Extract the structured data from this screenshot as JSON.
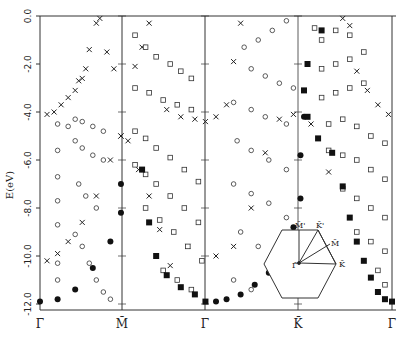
{
  "chart_data": {
    "type": "scatter",
    "title": "",
    "xlabel": "",
    "ylabel": "E(eV)",
    "ylim": [
      -12.0,
      0.0
    ],
    "yticks": [
      0.0,
      -2.0,
      -4.0,
      -6.0,
      -8.0,
      -10.0,
      -12.0
    ],
    "ytick_labels": [
      "0.0",
      "-2.0",
      "-4.0",
      "-6.0",
      "-8.0",
      "-10.0",
      "-12.0"
    ],
    "x_symmetry_points": [
      {
        "label": "Γ̄",
        "pos": 0.0
      },
      {
        "label": "M̄",
        "pos": 0.235
      },
      {
        "label": "Γ̄",
        "pos": 0.471
      },
      {
        "label": "K̄",
        "pos": 0.735
      },
      {
        "label": "Γ̄",
        "pos": 1.0
      }
    ],
    "legend": [],
    "marker_types": [
      "open-circle",
      "open-square",
      "cross",
      "filled-circle",
      "filled-square"
    ],
    "series": [
      {
        "name": "surface states (crosses)",
        "marker": "cross",
        "points": [
          [
            0.02,
            -4.1
          ],
          [
            0.04,
            -4.0
          ],
          [
            0.06,
            -3.7
          ],
          [
            0.08,
            -3.4
          ],
          [
            0.1,
            -3.1
          ],
          [
            0.12,
            -2.6
          ],
          [
            0.14,
            -1.4
          ],
          [
            0.16,
            -0.3
          ],
          [
            0.17,
            -0.1
          ],
          [
            0.19,
            -1.5
          ],
          [
            0.21,
            -2.2
          ],
          [
            0.23,
            -5.0
          ],
          [
            0.25,
            -5.2
          ],
          [
            0.27,
            -2.1
          ],
          [
            0.29,
            -1.3
          ],
          [
            0.31,
            -0.3
          ],
          [
            0.13,
            -2.2
          ],
          [
            0.11,
            -2.7
          ],
          [
            0.36,
            -3.9
          ],
          [
            0.4,
            -4.2
          ],
          [
            0.44,
            -4.3
          ],
          [
            0.47,
            -4.4
          ],
          [
            0.5,
            -4.2
          ],
          [
            0.53,
            -3.7
          ],
          [
            0.55,
            -1.9
          ],
          [
            0.57,
            -0.3
          ],
          [
            0.02,
            -10.2
          ],
          [
            0.05,
            -9.9
          ],
          [
            0.08,
            -9.4
          ],
          [
            0.12,
            -8.6
          ],
          [
            0.16,
            -7.5
          ],
          [
            0.2,
            -6.0
          ],
          [
            0.23,
            -5.0
          ],
          [
            0.28,
            -6.4
          ],
          [
            0.31,
            -7.5
          ],
          [
            0.34,
            -8.9
          ],
          [
            0.37,
            -10.4
          ],
          [
            0.42,
            -9.6
          ],
          [
            0.5,
            -10.0
          ],
          [
            0.55,
            -9.6
          ],
          [
            0.6,
            -8.0
          ],
          [
            0.64,
            -5.7
          ],
          [
            0.68,
            -4.3
          ],
          [
            0.72,
            -4.1
          ],
          [
            0.77,
            -4.5
          ],
          [
            0.82,
            -6.5
          ],
          [
            0.86,
            -0.1
          ],
          [
            0.88,
            -0.4
          ],
          [
            0.9,
            -2.3
          ],
          [
            0.93,
            -3.1
          ],
          [
            0.96,
            -3.7
          ],
          [
            0.99,
            -4.1
          ]
        ]
      },
      {
        "name": "bulk bands (open circles)",
        "marker": "open-circle",
        "points": [
          [
            0.05,
            -4.5
          ],
          [
            0.08,
            -4.6
          ],
          [
            0.05,
            -5.6
          ],
          [
            0.05,
            -6.7
          ],
          [
            0.05,
            -7.7
          ],
          [
            0.05,
            -8.7
          ],
          [
            0.05,
            -10.3
          ],
          [
            0.05,
            -11.0
          ],
          [
            0.1,
            -4.3
          ],
          [
            0.12,
            -4.4
          ],
          [
            0.15,
            -4.6
          ],
          [
            0.18,
            -4.8
          ],
          [
            0.1,
            -5.2
          ],
          [
            0.12,
            -5.5
          ],
          [
            0.15,
            -5.8
          ],
          [
            0.18,
            -6.0
          ],
          [
            0.11,
            -7.0
          ],
          [
            0.13,
            -7.5
          ],
          [
            0.16,
            -8.0
          ],
          [
            0.1,
            -9.1
          ],
          [
            0.12,
            -9.6
          ],
          [
            0.14,
            -10.3
          ],
          [
            0.16,
            -11.0
          ],
          [
            0.18,
            -11.5
          ],
          [
            0.2,
            -11.8
          ],
          [
            0.58,
            -1.3
          ],
          [
            0.62,
            -1.0
          ],
          [
            0.66,
            -0.6
          ],
          [
            0.7,
            -0.2
          ],
          [
            0.6,
            -2.2
          ],
          [
            0.64,
            -2.5
          ],
          [
            0.68,
            -2.8
          ],
          [
            0.72,
            -3.0
          ],
          [
            0.55,
            -3.6
          ],
          [
            0.6,
            -3.9
          ],
          [
            0.64,
            -4.2
          ],
          [
            0.7,
            -4.5
          ],
          [
            0.56,
            -5.2
          ],
          [
            0.6,
            -5.6
          ],
          [
            0.65,
            -6.0
          ],
          [
            0.7,
            -6.4
          ],
          [
            0.55,
            -7.0
          ],
          [
            0.6,
            -7.4
          ],
          [
            0.65,
            -7.8
          ],
          [
            0.7,
            -8.4
          ],
          [
            0.57,
            -9.0
          ],
          [
            0.62,
            -9.6
          ],
          [
            0.67,
            -10.2
          ],
          [
            0.72,
            -10.8
          ],
          [
            0.55,
            -11.0
          ],
          [
            0.6,
            -11.4
          ]
        ]
      },
      {
        "name": "bulk bands (open squares)",
        "marker": "open-square",
        "points": [
          [
            0.27,
            -0.8
          ],
          [
            0.3,
            -1.3
          ],
          [
            0.33,
            -1.7
          ],
          [
            0.37,
            -2.0
          ],
          [
            0.4,
            -2.3
          ],
          [
            0.43,
            -2.6
          ],
          [
            0.27,
            -3.0
          ],
          [
            0.31,
            -3.2
          ],
          [
            0.35,
            -3.5
          ],
          [
            0.39,
            -3.7
          ],
          [
            0.43,
            -3.9
          ],
          [
            0.27,
            -4.8
          ],
          [
            0.3,
            -5.1
          ],
          [
            0.33,
            -5.5
          ],
          [
            0.37,
            -5.9
          ],
          [
            0.41,
            -6.4
          ],
          [
            0.45,
            -6.9
          ],
          [
            0.27,
            -6.2
          ],
          [
            0.3,
            -6.6
          ],
          [
            0.33,
            -7.0
          ],
          [
            0.37,
            -7.5
          ],
          [
            0.41,
            -8.0
          ],
          [
            0.45,
            -8.6
          ],
          [
            0.3,
            -8.0
          ],
          [
            0.34,
            -8.5
          ],
          [
            0.38,
            -9.0
          ],
          [
            0.42,
            -9.6
          ],
          [
            0.46,
            -10.2
          ],
          [
            0.35,
            -10.6
          ],
          [
            0.39,
            -11.0
          ],
          [
            0.43,
            -11.4
          ],
          [
            0.78,
            -0.5
          ],
          [
            0.8,
            -1.0
          ],
          [
            0.84,
            -0.6
          ],
          [
            0.88,
            -0.8
          ],
          [
            0.8,
            -2.2
          ],
          [
            0.84,
            -2.0
          ],
          [
            0.88,
            -1.8
          ],
          [
            0.92,
            -1.5
          ],
          [
            0.8,
            -3.4
          ],
          [
            0.84,
            -3.2
          ],
          [
            0.88,
            -3.0
          ],
          [
            0.92,
            -2.8
          ],
          [
            0.82,
            -4.5
          ],
          [
            0.86,
            -4.3
          ],
          [
            0.9,
            -4.6
          ],
          [
            0.94,
            -5.0
          ],
          [
            0.98,
            -5.3
          ],
          [
            0.82,
            -5.6
          ],
          [
            0.86,
            -5.8
          ],
          [
            0.9,
            -6.0
          ],
          [
            0.94,
            -6.4
          ],
          [
            0.98,
            -6.8
          ],
          [
            0.86,
            -7.2
          ],
          [
            0.9,
            -7.6
          ],
          [
            0.94,
            -8.0
          ],
          [
            0.98,
            -8.4
          ],
          [
            0.9,
            -9.0
          ],
          [
            0.94,
            -9.4
          ],
          [
            0.98,
            -9.8
          ],
          [
            0.96,
            -10.6
          ],
          [
            0.98,
            -11.2
          ]
        ]
      },
      {
        "name": "bulk band edge (filled circles)",
        "marker": "filled-circle",
        "points": [
          [
            0.0,
            -11.9
          ],
          [
            0.05,
            -11.8
          ],
          [
            0.1,
            -11.4
          ],
          [
            0.15,
            -10.5
          ],
          [
            0.2,
            -9.4
          ],
          [
            0.23,
            -8.2
          ],
          [
            0.23,
            -7.0
          ],
          [
            0.5,
            -11.9
          ],
          [
            0.53,
            -11.8
          ],
          [
            0.57,
            -11.6
          ],
          [
            0.61,
            -11.2
          ],
          [
            0.65,
            -10.7
          ],
          [
            0.69,
            -9.9
          ],
          [
            0.72,
            -8.8
          ],
          [
            0.74,
            -7.6
          ],
          [
            0.74,
            -5.8
          ],
          [
            0.75,
            -4.2
          ]
        ]
      },
      {
        "name": "bulk band edge (filled squares)",
        "marker": "filled-square",
        "points": [
          [
            0.29,
            -6.4
          ],
          [
            0.31,
            -8.6
          ],
          [
            0.33,
            -10.0
          ],
          [
            0.36,
            -10.8
          ],
          [
            0.4,
            -11.3
          ],
          [
            0.44,
            -11.6
          ],
          [
            0.47,
            -11.9
          ],
          [
            0.76,
            -4.2
          ],
          [
            0.79,
            -5.1
          ],
          [
            0.76,
            -2.0
          ],
          [
            0.75,
            -3.1
          ],
          [
            0.8,
            -0.6
          ],
          [
            0.83,
            -5.7
          ],
          [
            0.86,
            -7.1
          ],
          [
            0.88,
            -8.4
          ],
          [
            0.9,
            -9.4
          ],
          [
            0.92,
            -10.2
          ],
          [
            0.94,
            -10.9
          ],
          [
            0.96,
            -11.5
          ],
          [
            0.98,
            -11.8
          ],
          [
            1.0,
            -11.9
          ]
        ]
      }
    ],
    "inset": {
      "description": "Hexagonal surface Brillouin zone with high-symmetry points",
      "labels": [
        "Γ̄",
        "M̄",
        "K̄",
        "M̄'",
        "K̄'"
      ]
    }
  },
  "axes": {
    "ylabel": "E(eV)",
    "yticks": [
      "0.0",
      "-2.0",
      "-4.0",
      "-6.0",
      "-8.0",
      "-10.0",
      "-12.0"
    ],
    "xticks": [
      "Γ̄",
      "M̄",
      "Γ̄",
      "K̄",
      "Γ̄"
    ]
  },
  "inset": {
    "gamma": "Γ̄",
    "m": "M̄",
    "k": "K̄",
    "m_prime": "M̄'",
    "k_prime": "K̄'"
  }
}
